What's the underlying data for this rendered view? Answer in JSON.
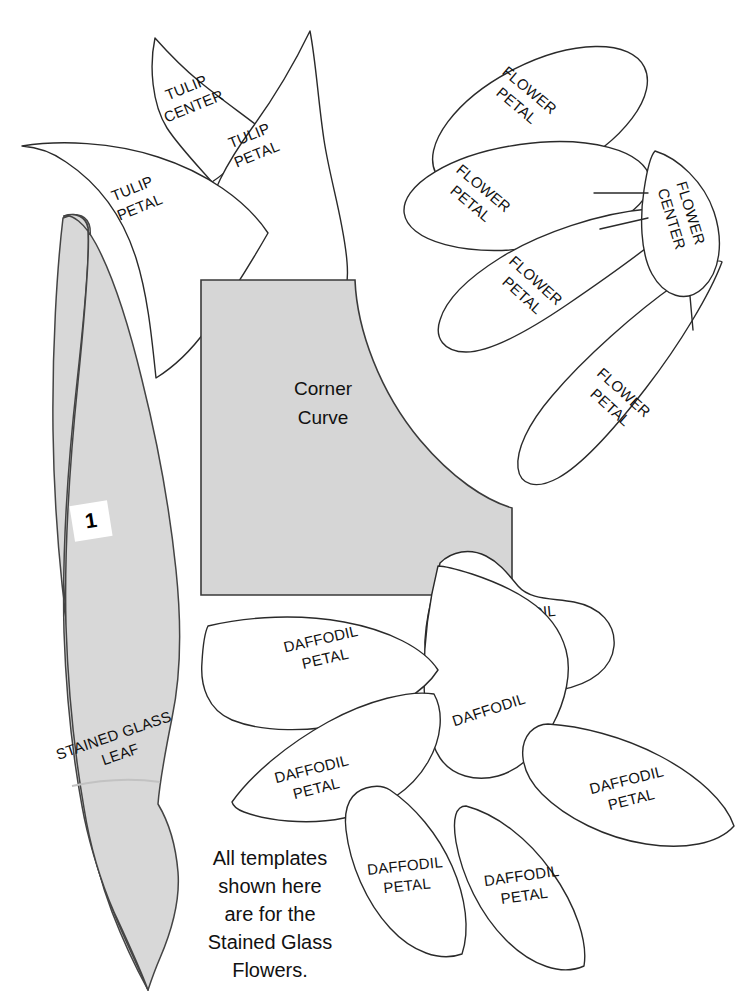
{
  "document": {
    "type": "sewing-template-sheet",
    "title": "Stained Glass Flowers Templates",
    "background_color": "#ffffff",
    "shaded_fill_color": "#d6d6d6",
    "outline_color": "#2a2a2a"
  },
  "note": {
    "lines": [
      "All templates",
      "shown here",
      "are for the",
      "Stained Glass",
      "Flowers."
    ]
  },
  "pieces": [
    {
      "id": "tulip-center",
      "label_lines": [
        "TULIP",
        "CENTER"
      ],
      "group": "tulip",
      "shaded": false,
      "rotation": -22
    },
    {
      "id": "tulip-petal-left",
      "label_lines": [
        "TULIP",
        "PETAL"
      ],
      "group": "tulip",
      "shaded": false,
      "rotation": -22
    },
    {
      "id": "tulip-petal-right",
      "label_lines": [
        "TULIP",
        "PETAL"
      ],
      "group": "tulip",
      "shaded": false,
      "rotation": -22
    },
    {
      "id": "flower-petal-1",
      "label_lines": [
        "FLOWER",
        "PETAL"
      ],
      "group": "flower",
      "shaded": false,
      "rotation": 38
    },
    {
      "id": "flower-petal-2",
      "label_lines": [
        "FLOWER",
        "PETAL"
      ],
      "group": "flower",
      "shaded": false,
      "rotation": 38
    },
    {
      "id": "flower-petal-3",
      "label_lines": [
        "FLOWER",
        "PETAL"
      ],
      "group": "flower",
      "shaded": false,
      "rotation": 42
    },
    {
      "id": "flower-petal-4",
      "label_lines": [
        "FLOWER",
        "PETAL"
      ],
      "group": "flower",
      "shaded": false,
      "rotation": 42
    },
    {
      "id": "flower-center",
      "label_lines": [
        "FLOWER",
        "CENTER"
      ],
      "group": "flower",
      "shaded": false,
      "rotation": 72
    },
    {
      "id": "corner-curve",
      "label_lines": [
        "Corner",
        "Curve"
      ],
      "group": "corner",
      "shaded": true,
      "rotation": 0
    },
    {
      "id": "stained-glass-leaf",
      "label_lines": [
        "STAINED GLASS",
        "LEAF"
      ],
      "group": "leaf",
      "shaded": true,
      "rotation": -20,
      "number": "1"
    },
    {
      "id": "daffodil-center",
      "label_lines": [
        "DAFFODIL",
        "CENTER"
      ],
      "group": "daffodil",
      "shaded": false,
      "rotation": -6
    },
    {
      "id": "daffodil-body",
      "label_lines": [
        "DAFFODIL"
      ],
      "group": "daffodil",
      "shaded": false,
      "rotation": -18
    },
    {
      "id": "daffodil-petal-upper-left",
      "label_lines": [
        "DAFFODIL",
        "PETAL"
      ],
      "group": "daffodil",
      "shaded": false,
      "rotation": -14
    },
    {
      "id": "daffodil-petal-left",
      "label_lines": [
        "DAFFODIL",
        "PETAL"
      ],
      "group": "daffodil",
      "shaded": false,
      "rotation": -14
    },
    {
      "id": "daffodil-petal-bottom-left",
      "label_lines": [
        "DAFFODIL",
        "PETAL"
      ],
      "group": "daffodil",
      "shaded": false,
      "rotation": -8
    },
    {
      "id": "daffodil-petal-bottom-right",
      "label_lines": [
        "DAFFODIL",
        "PETAL"
      ],
      "group": "daffodil",
      "shaded": false,
      "rotation": -8
    },
    {
      "id": "daffodil-petal-right",
      "label_lines": [
        "DAFFODIL",
        "PETAL"
      ],
      "group": "daffodil",
      "shaded": false,
      "rotation": -14
    }
  ],
  "labels": {
    "tulip_center_l1": "TULIP",
    "tulip_center_l2": "CENTER",
    "tulip_petal_l1": "TULIP",
    "tulip_petal_l2": "PETAL",
    "flower_l1": "FLOWER",
    "flower_petal_l2": "PETAL",
    "flower_center_l2": "CENTER",
    "corner_l1": "Corner",
    "corner_l2": "Curve",
    "leaf_l1": "STAINED GLASS",
    "leaf_l2": "LEAF",
    "leaf_number": "1",
    "daffodil": "DAFFODIL",
    "daffodil_center_l2": "CENTER",
    "daffodil_petal_l2": "PETAL"
  }
}
